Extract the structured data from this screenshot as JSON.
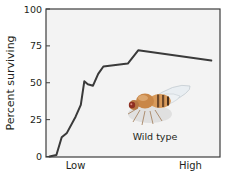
{
  "chart_data": {
    "type": "line",
    "title": "",
    "xlabel": "",
    "ylabel": "Percent surviving",
    "ylim": [
      0,
      100
    ],
    "xlim": [
      0,
      100
    ],
    "yticks": [
      0,
      25,
      50,
      75,
      100
    ],
    "xtick_labels": [
      {
        "label": "Low",
        "pos": 17
      },
      {
        "label": "High",
        "pos": 83
      }
    ],
    "grid": false,
    "legend": null,
    "series": [
      {
        "name": "Wild type",
        "color": "#3a3a3a",
        "x": [
          2,
          6,
          9,
          12,
          17,
          20,
          22,
          24,
          27,
          30,
          33,
          40,
          47,
          53,
          95
        ],
        "y": [
          0,
          1,
          13,
          16,
          27,
          35,
          51,
          49,
          48,
          56,
          61,
          62,
          63,
          72,
          65
        ]
      }
    ],
    "annotations": [
      {
        "text": "Wild type",
        "type": "image-label",
        "description": "illustration of a fruit fly (Drosophila) above label"
      }
    ]
  },
  "plot": {
    "background": "#f3f3f3",
    "frame_color": "#3d3d3d",
    "line_color": "#3a3a3a"
  }
}
